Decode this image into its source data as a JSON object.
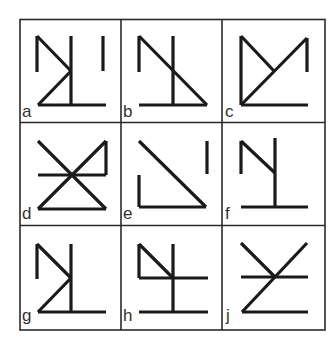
{
  "figure": {
    "rows": 3,
    "cols": 3,
    "colors": {
      "grid": "#2a2a2a",
      "stroke": "#1a1a1a",
      "label": "#333333",
      "background": "#ffffff"
    },
    "cells": [
      {
        "label": "a",
        "lines": [
          [
            37,
            36,
            37,
            72
          ],
          [
            37,
            36,
            71,
            71
          ],
          [
            71,
            36,
            71,
            105
          ],
          [
            71,
            71,
            38,
            105
          ],
          [
            38,
            105,
            106,
            105
          ],
          [
            103,
            36,
            103,
            71
          ]
        ]
      },
      {
        "label": "b",
        "lines": [
          [
            139,
            36,
            139,
            72
          ],
          [
            139,
            36,
            207,
            105
          ],
          [
            173,
            36,
            173,
            105
          ],
          [
            139,
            105,
            207,
            105
          ]
        ]
      },
      {
        "label": "c",
        "lines": [
          [
            241,
            36,
            241,
            105
          ],
          [
            241,
            36,
            274,
            71
          ],
          [
            241,
            105,
            307,
            38
          ],
          [
            307,
            38,
            307,
            72
          ],
          [
            241,
            105,
            308,
            105
          ]
        ]
      },
      {
        "label": "d",
        "lines": [
          [
            38,
            141,
            106,
            209
          ],
          [
            38,
            209,
            106,
            141
          ],
          [
            38,
            175,
            106,
            175
          ],
          [
            106,
            141,
            106,
            175
          ],
          [
            38,
            209,
            106,
            209
          ]
        ]
      },
      {
        "label": "e",
        "lines": [
          [
            139,
            141,
            206,
            207
          ],
          [
            139,
            175,
            139,
            207
          ],
          [
            139,
            207,
            206,
            207
          ],
          [
            207,
            141,
            207,
            174
          ]
        ]
      },
      {
        "label": "f",
        "lines": [
          [
            241,
            141,
            241,
            174
          ],
          [
            241,
            141,
            275,
            173
          ],
          [
            275,
            138,
            275,
            207
          ],
          [
            241,
            207,
            308,
            207
          ]
        ]
      },
      {
        "label": "g",
        "lines": [
          [
            37,
            244,
            37,
            279
          ],
          [
            37,
            244,
            71,
            278
          ],
          [
            71,
            244,
            71,
            312
          ],
          [
            71,
            278,
            38,
            312
          ],
          [
            38,
            312,
            106,
            312
          ]
        ]
      },
      {
        "label": "h",
        "lines": [
          [
            139,
            244,
            139,
            278
          ],
          [
            139,
            244,
            173,
            278
          ],
          [
            139,
            278,
            208,
            278
          ],
          [
            173,
            244,
            173,
            312
          ],
          [
            139,
            312,
            208,
            312
          ]
        ]
      },
      {
        "label": "j",
        "lines": [
          [
            241,
            243,
            275,
            277
          ],
          [
            307,
            243,
            242,
            312
          ],
          [
            241,
            277,
            308,
            277
          ],
          [
            242,
            312,
            308,
            312
          ]
        ]
      }
    ]
  }
}
